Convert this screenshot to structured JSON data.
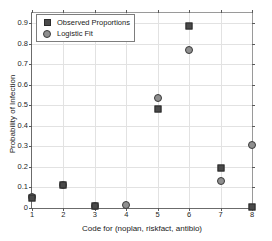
{
  "chart_data": {
    "type": "scatter",
    "title": "",
    "xlabel": "Code for (noplan, riskfact, antibio)",
    "ylabel": "Probability of Infection",
    "x": [
      1,
      2,
      3,
      4,
      5,
      6,
      7,
      8
    ],
    "xlim": [
      1,
      8
    ],
    "ylim": [
      0,
      0.95
    ],
    "xticks": [
      1,
      2,
      3,
      4,
      5,
      6,
      7,
      8
    ],
    "xtick_labels": [
      "1",
      "2",
      "3",
      "4",
      "5",
      "6",
      "7",
      "8"
    ],
    "yticks": [
      0,
      0.1,
      0.2,
      0.3,
      0.4,
      0.5,
      0.6,
      0.7,
      0.8,
      0.9
    ],
    "ytick_labels": [
      "0",
      "0.1",
      "0.2",
      "0.3",
      "0.4",
      "0.5",
      "0.6",
      "0.7",
      "0.8",
      "0.9"
    ],
    "grid": true,
    "legend_position": "upper left",
    "series": [
      {
        "name": "Observed Proportions",
        "marker": "square",
        "color": "#4a4a4a",
        "values": [
          0.05,
          0.11,
          0.01,
          null,
          0.48,
          0.885,
          0.197,
          0.005
        ]
      },
      {
        "name": "Logistic Fit",
        "marker": "circle",
        "color": "#8f8f8f",
        "values": [
          0.055,
          0.112,
          0.012,
          0.015,
          0.535,
          0.77,
          0.13,
          0.305
        ]
      }
    ]
  },
  "legend": {
    "entries": [
      {
        "label": "Observed Proportions",
        "marker": "square"
      },
      {
        "label": "Logistic Fit",
        "marker": "circle"
      }
    ]
  },
  "colors": {
    "observed": "#4a4a4a",
    "fit": "#8f8f8f",
    "axis": "#6b6b6b",
    "grid": "#e2e2e2",
    "background": "#ffffff"
  }
}
